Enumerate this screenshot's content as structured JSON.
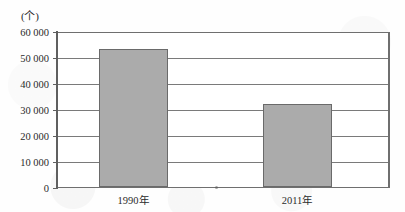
{
  "chart_data": {
    "type": "bar",
    "title": "",
    "subtitle": "",
    "unit_label": "(个)",
    "xlabel": "",
    "ylabel": "",
    "categories": [
      "1990年",
      "2011年"
    ],
    "values": [
      53800,
      32400
    ],
    "series": [
      {
        "name": "数量",
        "values": [
          53800,
          32400
        ]
      }
    ],
    "ylim": [
      0,
      60000
    ],
    "y_ticks": [
      0,
      10000,
      20000,
      30000,
      40000,
      50000,
      60000
    ],
    "y_tick_labels": [
      "0",
      "10 000",
      "20 000",
      "30 000",
      "40 000",
      "50 000",
      "60 000"
    ],
    "grid": true,
    "grid_axis": "y",
    "legend": false,
    "legend_position": "none",
    "bar_fill_color": "#ababab",
    "bar_border_color": "#6a6a6a",
    "axis_color": "#5f5f5f",
    "gridline_color": "#7a7a7a",
    "text_color": "#2b2b2b",
    "background_color": "#ffffff",
    "annotations": []
  }
}
